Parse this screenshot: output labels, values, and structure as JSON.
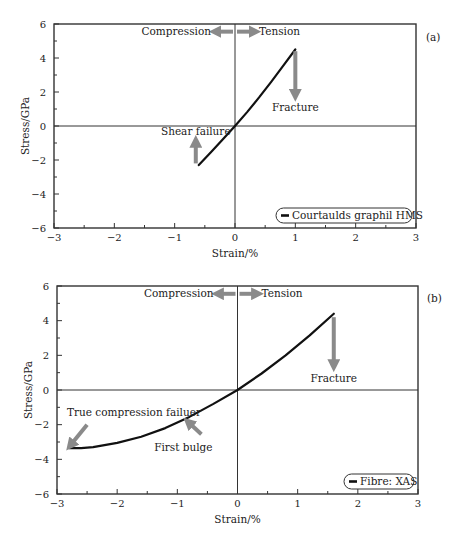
{
  "chart_data": [
    {
      "type": "line",
      "panel_label": "(a)",
      "title": "",
      "xlabel": "Strain/%",
      "ylabel": "Stress/GPa",
      "xlim": [
        -3,
        3
      ],
      "ylim": [
        -6,
        6
      ],
      "xticks": [
        -3,
        -2,
        -1,
        0,
        1,
        2,
        3
      ],
      "xtick_labels": [
        "−3",
        "−2",
        "−1",
        "0",
        "1",
        "2",
        "3"
      ],
      "yticks": [
        -6,
        -4,
        -2,
        0,
        2,
        4,
        6
      ],
      "ytick_labels": [
        "−6",
        "−4",
        "−2",
        "0",
        "2",
        "4",
        "6"
      ],
      "grid": false,
      "reference_lines": {
        "x0": true,
        "y0": true
      },
      "legend": {
        "position": "lower right",
        "entries": [
          "Courtaulds graphil HMS"
        ]
      },
      "series": [
        {
          "name": "Courtaulds graphil HMS",
          "x": [
            -0.6,
            -0.4,
            -0.2,
            0.0,
            0.2,
            0.4,
            0.6,
            0.8,
            1.0
          ],
          "y": [
            -2.3,
            -1.55,
            -0.78,
            0.0,
            0.82,
            1.68,
            2.6,
            3.55,
            4.5
          ]
        }
      ],
      "annotations": [
        {
          "text": "Compression",
          "x": -0.35,
          "y": 5.55,
          "arrow": "left"
        },
        {
          "text": "Tension",
          "x": 0.35,
          "y": 5.55,
          "arrow": "right"
        },
        {
          "text": "Fracture",
          "x": 1.0,
          "y": 1.1,
          "arrow": "down",
          "arrow_from": [
            1.0,
            4.4
          ],
          "arrow_to": [
            1.0,
            1.8
          ]
        },
        {
          "text": "Shear failure",
          "x": -0.65,
          "y": -0.35,
          "arrow": "up",
          "arrow_from": [
            -0.65,
            -2.2
          ],
          "arrow_to": [
            -0.65,
            -0.9
          ]
        }
      ]
    },
    {
      "type": "line",
      "panel_label": "(b)",
      "title": "",
      "xlabel": "Strain/%",
      "ylabel": "Stress/GPa",
      "xlim": [
        -3,
        3
      ],
      "ylim": [
        -6,
        6
      ],
      "xticks": [
        -3,
        -2,
        -1,
        0,
        1,
        2,
        3
      ],
      "xtick_labels": [
        "−3",
        "−2",
        "−1",
        "0",
        "1",
        "2",
        "3"
      ],
      "yticks": [
        -6,
        -4,
        -2,
        0,
        2,
        4,
        6
      ],
      "ytick_labels": [
        "−6",
        "−4",
        "−2",
        "0",
        "2",
        "4",
        "6"
      ],
      "grid": false,
      "reference_lines": {
        "x0": true,
        "y0": true
      },
      "legend": {
        "position": "lower right",
        "entries": [
          "Fibre: XAS"
        ]
      },
      "series": [
        {
          "name": "Fibre: XAS",
          "x": [
            -2.8,
            -2.6,
            -2.4,
            -2.0,
            -1.6,
            -1.2,
            -0.8,
            -0.4,
            0.0,
            0.4,
            0.8,
            1.2,
            1.6
          ],
          "y": [
            -3.35,
            -3.35,
            -3.3,
            -3.05,
            -2.7,
            -2.2,
            -1.55,
            -0.8,
            0.0,
            0.95,
            2.0,
            3.15,
            4.4
          ]
        }
      ],
      "annotations": [
        {
          "text": "Compression",
          "x": -0.35,
          "y": 5.55,
          "arrow": "left"
        },
        {
          "text": "Tension",
          "x": 0.35,
          "y": 5.55,
          "arrow": "right"
        },
        {
          "text": "Fracture",
          "x": 1.6,
          "y": 0.65,
          "arrow": "down",
          "arrow_from": [
            1.6,
            4.2
          ],
          "arrow_to": [
            1.6,
            1.4
          ]
        },
        {
          "text": "True compression failuer",
          "x": -2.5,
          "y": -1.3,
          "arrow": "down-left",
          "arrow_from": [
            -2.5,
            -2.0
          ],
          "arrow_to": [
            -2.78,
            -3.2
          ]
        },
        {
          "text": "First bulge",
          "x": -0.9,
          "y": -3.3,
          "arrow": "up-left",
          "arrow_from": [
            -0.6,
            -2.55
          ],
          "arrow_to": [
            -0.82,
            -1.85
          ]
        }
      ]
    }
  ]
}
